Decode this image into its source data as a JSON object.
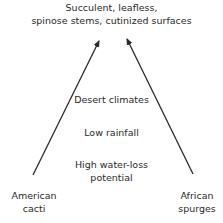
{
  "diagram": {
    "top_label": [
      "Succulent, leafless,",
      "spinose stems, cutinized surfaces"
    ],
    "middle_labels": [
      "Desert climates",
      "Low rainfall"
    ],
    "bottom_center_label": [
      "High water-loss",
      "potential"
    ],
    "left_label": [
      "American",
      "cacti"
    ],
    "right_label": [
      "African",
      "spurges"
    ],
    "arrows": [
      {
        "name": "left-arrow",
        "from": [
          33,
          175
        ],
        "to": [
          99,
          40
        ]
      },
      {
        "name": "right-arrow",
        "from": [
          193,
          174
        ],
        "to": [
          126,
          38
        ]
      }
    ],
    "line_color": "#2a2a2a"
  }
}
